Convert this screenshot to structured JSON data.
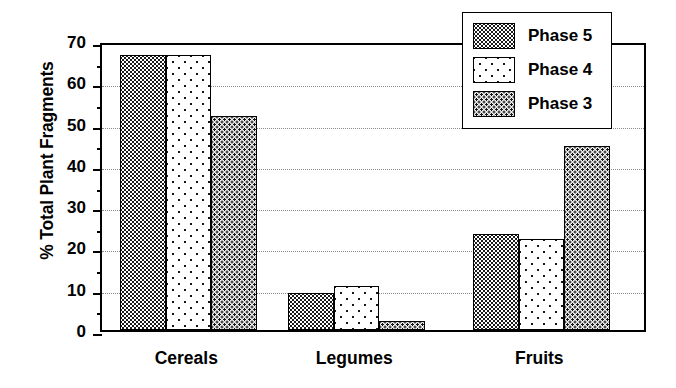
{
  "chart_data": {
    "type": "bar",
    "title": "",
    "xlabel": "",
    "ylabel": "% Total Plant Fragments",
    "ylim": [
      0,
      70
    ],
    "ytick_step": 10,
    "yminor_step": 5,
    "grid": true,
    "grid_style": "dotted horizontal",
    "legend_position": "top-right inside plot",
    "categories": [
      "Cereals",
      "Legumes",
      "Fruits"
    ],
    "series": [
      {
        "name": "Phase 5",
        "pattern": "dense-dark-dotted",
        "values": [
          66.5,
          9.0,
          23.3
        ]
      },
      {
        "name": "Phase 4",
        "pattern": "sparse-dots-white",
        "values": [
          66.5,
          10.6,
          22.0
        ]
      },
      {
        "name": "Phase 3",
        "pattern": "medium-dots-light-gray",
        "values": [
          51.8,
          2.3,
          44.6
        ]
      }
    ],
    "ytick_labels": [
      "70",
      "60",
      "50",
      "40",
      "30",
      "20",
      "10",
      "0"
    ],
    "ytick_values": [
      70,
      60,
      50,
      40,
      30,
      20,
      10,
      0
    ],
    "colors": {
      "axis": "#000000",
      "grid": "#8a8a8a",
      "background": "#ffffff",
      "phase5": "#1a1a1a",
      "phase4": "#ffffff",
      "phase3": "#f0f0f0"
    }
  },
  "legend": {
    "items": [
      {
        "label": "Phase 5"
      },
      {
        "label": "Phase 4"
      },
      {
        "label": "Phase 3"
      }
    ]
  }
}
